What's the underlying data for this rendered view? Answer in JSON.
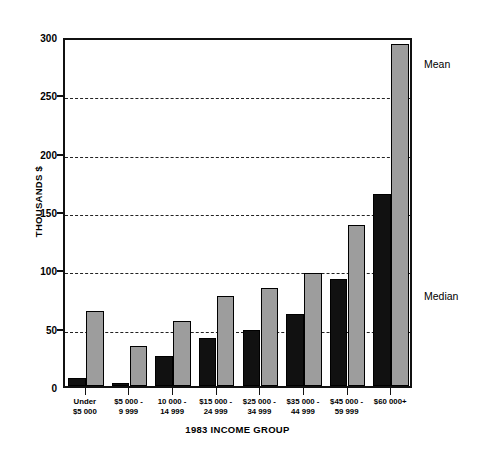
{
  "chart_data": {
    "type": "bar",
    "title": "",
    "xlabel": "1983 INCOME GROUP",
    "ylabel": "THOUSANDS $",
    "ylim": [
      0,
      300
    ],
    "yticks": [
      0,
      50,
      100,
      150,
      200,
      250,
      300
    ],
    "ytick_labels": [
      "0",
      "50",
      "100",
      "150",
      "200",
      "250",
      "300"
    ],
    "grid": true,
    "legend_position": "right-inline",
    "categories": [
      "Under\n$5 000",
      "$5 000 -\n9 999",
      "10 000 -\n14 999",
      "$15 000 -\n24 999",
      "$25 000 -\n34 999",
      "$35 000 -\n44 999",
      "$45 000 -\n59 999",
      "$60 000+"
    ],
    "category_lines": [
      [
        "Under",
        "$5 000"
      ],
      [
        "$5 000 -",
        "9 999"
      ],
      [
        "10 000 -",
        "14 999"
      ],
      [
        "$15 000 -",
        "24 999"
      ],
      [
        "$25 000 -",
        "34 999"
      ],
      [
        "$35 000 -",
        "44 999"
      ],
      [
        "$45 000 -",
        "59 999"
      ],
      [
        "$60 000+",
        ""
      ]
    ],
    "series": [
      {
        "name": "Median",
        "color": "#111111",
        "values": [
          7,
          3,
          26,
          41,
          48,
          62,
          92,
          165
        ]
      },
      {
        "name": "Mean",
        "color": "#9d9d9d",
        "values": [
          64,
          34,
          56,
          77,
          84,
          97,
          138,
          293
        ]
      }
    ],
    "annotations": [
      {
        "text": "Mean",
        "y_px": 58
      },
      {
        "text": "Median",
        "y_px": 290
      }
    ]
  },
  "axis": {
    "y_title": "THOUSANDS $",
    "x_title": "1983 INCOME GROUP"
  }
}
